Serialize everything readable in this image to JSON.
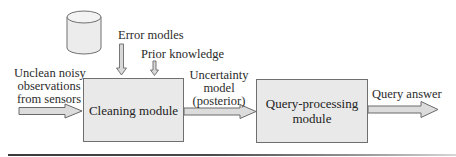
{
  "diagram": {
    "type": "data-flow pipeline",
    "nodes": [
      {
        "id": "database",
        "shape": "cylinder",
        "label": ""
      },
      {
        "id": "cleaning",
        "shape": "rectangle",
        "label": "Cleaning module"
      },
      {
        "id": "query",
        "shape": "rectangle",
        "label_lines": [
          "Query-processing",
          "module"
        ]
      }
    ],
    "inputs": {
      "sensor_input": {
        "label_lines": [
          "Unclean noisy",
          "observations",
          "from sensors"
        ]
      },
      "error_models": {
        "label": "Error modles"
      },
      "prior_knowledge": {
        "label": "Prior knowledge"
      }
    },
    "edges": {
      "uncertainty": {
        "label_lines": [
          "Uncertainty",
          "model",
          "(posterior)"
        ]
      },
      "answer": {
        "label": "Query answer"
      }
    },
    "colors": {
      "box_fill": "#e9e9e9",
      "box_border": "#6f6f6f",
      "arrow_fill": "#dcdcdc",
      "arrow_stroke": "#6a6a6a",
      "text": "#2b2b2b"
    }
  }
}
